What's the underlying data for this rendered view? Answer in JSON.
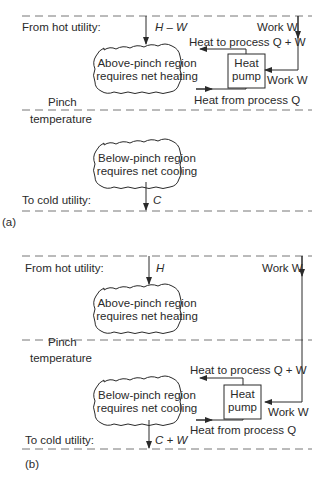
{
  "panel_a": {
    "caption": "(a)",
    "hot_utility_label": "From hot utility:",
    "hot_flow": "H – W",
    "work_in": "Work W",
    "heat_to_process": "Heat to process Q + W",
    "heat_pump_line1": "Heat",
    "heat_pump_line2": "pump",
    "work_label2": "Work W",
    "heat_from_process": "Heat from process Q",
    "above_region_line1": "Above-pinch region",
    "above_region_line2": "requires net heating",
    "pinch_line1": "Pinch",
    "pinch_line2": "temperature",
    "below_region_line1": "Below-pinch region",
    "below_region_line2": "requires net cooling",
    "cold_utility_label": "To cold utility:",
    "cold_flow": "C"
  },
  "panel_b": {
    "caption": "(b)",
    "hot_utility_label": "From hot utility:",
    "hot_flow": "H",
    "work_in": "Work W",
    "above_region_line1": "Above-pinch region",
    "above_region_line2": "requires net heating",
    "pinch_line1": "Pinch",
    "pinch_line2": "temperature",
    "heat_to_process": "Heat to process Q + W",
    "heat_pump_line1": "Heat",
    "heat_pump_line2": "pump",
    "work_label2": "Work W",
    "heat_from_process": "Heat from process Q",
    "below_region_line1": "Below-pinch region",
    "below_region_line2": "requires net cooling",
    "cold_utility_label": "To cold utility:",
    "cold_flow": "C + W"
  }
}
